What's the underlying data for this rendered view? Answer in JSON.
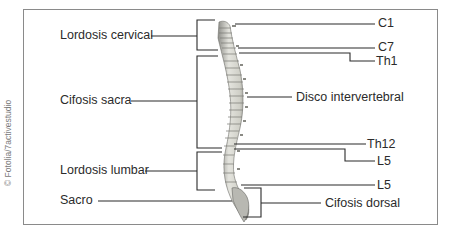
{
  "diagram": {
    "credit": "© Fotolia/7activestudio",
    "left_labels": {
      "lordosis_cervical": "Lordosis cervical",
      "cifosis_sacra": "Cifosis sacra",
      "lordosis_lumbar": "Lordosis lumbar",
      "sacro": "Sacro"
    },
    "right_labels": {
      "c1": "C1",
      "c7": "C7",
      "th1": "Th1",
      "disco": "Disco intervertebral",
      "th12": "Th12",
      "l5_upper": "L5",
      "l5_lower": "L5",
      "cifosis_dorsal": "Cifosis dorsal"
    },
    "colors": {
      "line": "#2b2b2b",
      "frame": "#8a8a8a",
      "bone": "#d9d9d2",
      "bone_shade": "#9a9a94"
    }
  }
}
